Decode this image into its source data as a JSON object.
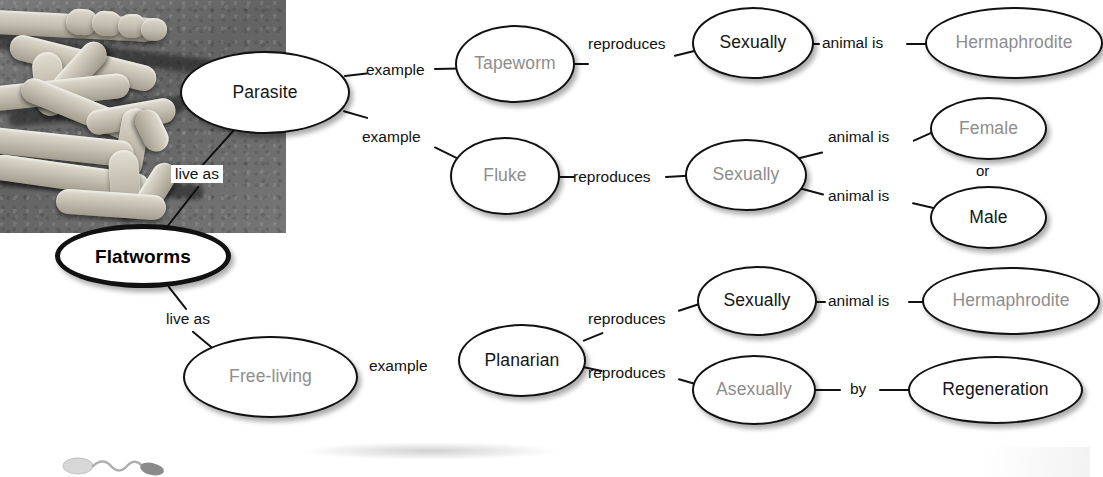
{
  "diagram": {
    "type": "concept-map",
    "photo_caption": "flatworm-photograph",
    "root": {
      "label": "Flatworms",
      "emphasis": "bold-black"
    },
    "nodes": [
      {
        "id": "parasite",
        "label": "Parasite",
        "text_color": "black"
      },
      {
        "id": "free-living",
        "label": "Free-living",
        "text_color": "gray"
      },
      {
        "id": "tapeworm",
        "label": "Tapeworm",
        "text_color": "gray"
      },
      {
        "id": "fluke",
        "label": "Fluke",
        "text_color": "gray"
      },
      {
        "id": "planarian",
        "label": "Planarian",
        "text_color": "black"
      },
      {
        "id": "sexually-1",
        "label": "Sexually",
        "text_color": "black"
      },
      {
        "id": "sexually-2",
        "label": "Sexually",
        "text_color": "gray"
      },
      {
        "id": "sexually-3",
        "label": "Sexually",
        "text_color": "black"
      },
      {
        "id": "asexually",
        "label": "Asexually",
        "text_color": "gray"
      },
      {
        "id": "hermaphrodite-1",
        "label": "Hermaphrodite",
        "text_color": "gray"
      },
      {
        "id": "female",
        "label": "Female",
        "text_color": "gray"
      },
      {
        "id": "male",
        "label": "Male",
        "text_color": "black"
      },
      {
        "id": "hermaphrodite-2",
        "label": "Hermaphrodite",
        "text_color": "gray"
      },
      {
        "id": "regeneration",
        "label": "Regeneration",
        "text_color": "black"
      }
    ],
    "edges": [
      {
        "from": "flatworms",
        "to": "parasite",
        "label": "live as",
        "boxed": true
      },
      {
        "from": "flatworms",
        "to": "free-living",
        "label": "live as",
        "boxed": false
      },
      {
        "from": "parasite",
        "to": "tapeworm",
        "label": "example",
        "boxed": false
      },
      {
        "from": "parasite",
        "to": "fluke",
        "label": "example",
        "boxed": false
      },
      {
        "from": "free-living",
        "to": "planarian",
        "label": "example",
        "boxed": false
      },
      {
        "from": "tapeworm",
        "to": "sexually-1",
        "label": "reproduces",
        "boxed": false
      },
      {
        "from": "fluke",
        "to": "sexually-2",
        "label": "reproduces",
        "boxed": false
      },
      {
        "from": "planarian",
        "to": "sexually-3",
        "label": "reproduces",
        "boxed": false
      },
      {
        "from": "planarian",
        "to": "asexually",
        "label": "reproduces",
        "boxed": false
      },
      {
        "from": "sexually-1",
        "to": "hermaphrodite-1",
        "label": "animal is",
        "boxed": false
      },
      {
        "from": "sexually-2",
        "to": "female",
        "label": "animal is",
        "boxed": false
      },
      {
        "from": "sexually-2",
        "to": "male",
        "label": "animal is",
        "boxed": false
      },
      {
        "from": "sexually-3",
        "to": "hermaphrodite-2",
        "label": "animal is",
        "boxed": false
      },
      {
        "from": "asexually",
        "to": "regeneration",
        "label": "by",
        "boxed": false
      }
    ],
    "standalone_labels": [
      {
        "id": "or-connector",
        "label": "or"
      }
    ],
    "colors": {
      "node_border": "#111111",
      "node_fill": "#ffffff",
      "text_black": "#151515",
      "text_gray": "#8d8d8d",
      "photo_background": "#6f6f6f"
    }
  },
  "labels": {
    "live_as_1": "live as",
    "live_as_2": "live as",
    "example_1": "example",
    "example_2": "example",
    "example_3": "example",
    "reproduces_1": "reproduces",
    "reproduces_2": "reproduces",
    "reproduces_3": "reproduces",
    "reproduces_4": "reproduces",
    "animal_is_1": "animal is",
    "animal_is_2": "animal is",
    "animal_is_3": "animal is",
    "animal_is_4": "animal is",
    "by": "by",
    "or": "or"
  },
  "nodes_text": {
    "flatworms": "Flatworms",
    "parasite": "Parasite",
    "free_living": "Free-living",
    "tapeworm": "Tapeworm",
    "fluke": "Fluke",
    "planarian": "Planarian",
    "sexually_1": "Sexually",
    "sexually_2": "Sexually",
    "sexually_3": "Sexually",
    "asexually": "Asexually",
    "hermaphrodite_1": "Hermaphrodite",
    "female": "Female",
    "male": "Male",
    "hermaphrodite_2": "Hermaphrodite",
    "regeneration": "Regeneration"
  }
}
